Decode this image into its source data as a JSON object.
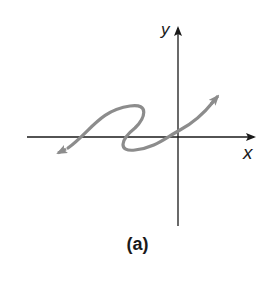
{
  "figure": {
    "caption": "(a)",
    "x_axis_label": "x",
    "y_axis_label": "y",
    "curve_color": "#8c8c8c",
    "axis_color": "#1a1a1a"
  }
}
